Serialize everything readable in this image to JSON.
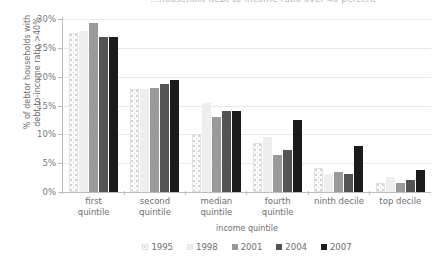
{
  "title_cropped": "…household debt-to-income ratio over 40 percent",
  "chart_data": {
    "type": "bar",
    "title": "",
    "xlabel": "income quintile",
    "ylabel": "% of debtor households with debt-to-income ratio >40%",
    "ylabel_line1": "% of debtor households with",
    "ylabel_line2": "debt-to-income ratio >40%",
    "ylim": [
      0,
      30
    ],
    "ytick_step": 5,
    "yticks": [
      "0%",
      "5%",
      "10%",
      "15%",
      "20%",
      "25%",
      "30%"
    ],
    "grid": true,
    "legend_position": "bottom",
    "categories": [
      "first quintile",
      "second quintile",
      "median quintile",
      "fourth quintile",
      "ninth decile",
      "top decile"
    ],
    "categories_lines": [
      [
        "first",
        "quintile"
      ],
      [
        "second",
        "quintile"
      ],
      [
        "median",
        "quintile"
      ],
      [
        "fourth",
        "quintile"
      ],
      [
        "ninth decile",
        ""
      ],
      [
        "top decile",
        ""
      ]
    ],
    "series": [
      {
        "name": "1995",
        "color": "#fbfbfb",
        "style": "dotted",
        "values": [
          27.5,
          17.8,
          10.0,
          8.5,
          4.1,
          1.6
        ]
      },
      {
        "name": "1998",
        "color": "#eeeeee",
        "style": "solid",
        "values": [
          28.0,
          17.8,
          15.5,
          9.5,
          3.2,
          2.6
        ]
      },
      {
        "name": "2001",
        "color": "#9a9a9a",
        "style": "solid",
        "values": [
          29.3,
          18.1,
          13.0,
          6.5,
          3.5,
          1.6
        ]
      },
      {
        "name": "2004",
        "color": "#545454",
        "style": "solid",
        "values": [
          26.8,
          18.8,
          14.0,
          7.3,
          3.2,
          2.1
        ]
      },
      {
        "name": "2007",
        "color": "#1b1b1b",
        "style": "solid",
        "values": [
          26.9,
          19.5,
          14.1,
          12.5,
          8.0,
          3.8
        ]
      }
    ]
  },
  "legend": {
    "items": [
      {
        "label": "1995"
      },
      {
        "label": "1998"
      },
      {
        "label": "2001"
      },
      {
        "label": "2004"
      },
      {
        "label": "2007"
      }
    ]
  }
}
